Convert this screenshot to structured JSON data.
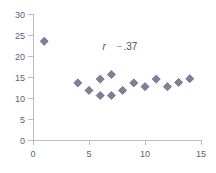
{
  "chart_data": {
    "type": "scatter",
    "title": "",
    "xlabel": "",
    "ylabel": "",
    "xlim": [
      0,
      15
    ],
    "ylim": [
      0,
      30
    ],
    "xticks": [
      "0",
      "5",
      "10",
      "15"
    ],
    "xtick_values": [
      0,
      5,
      10,
      15
    ],
    "yticks": [
      "0",
      "5",
      "10",
      "15",
      "20",
      "25",
      "30"
    ],
    "ytick_values": [
      0,
      5,
      10,
      15,
      20,
      25,
      30
    ],
    "grid": false,
    "legend": false,
    "marker_shape": "diamond",
    "marker_color": "#7d8098",
    "marker_edge_color": "#5c5f78",
    "axis_color": "#b9bcc6",
    "tick_label_color": "#5a5f7a",
    "points": [
      {
        "x": 1,
        "y": 23.5
      },
      {
        "x": 4,
        "y": 13.6
      },
      {
        "x": 5,
        "y": 11.8
      },
      {
        "x": 6,
        "y": 14.5
      },
      {
        "x": 6,
        "y": 10.6
      },
      {
        "x": 7,
        "y": 15.6
      },
      {
        "x": 7,
        "y": 10.6
      },
      {
        "x": 8,
        "y": 11.8
      },
      {
        "x": 9,
        "y": 13.6
      },
      {
        "x": 10,
        "y": 12.7
      },
      {
        "x": 11,
        "y": 14.5
      },
      {
        "x": 12,
        "y": 12.7
      },
      {
        "x": 13,
        "y": 13.7
      },
      {
        "x": 14,
        "y": 14.6
      }
    ],
    "annotations": [
      {
        "name": "correlation-annotation",
        "symbol": "r",
        "sign": "−",
        "value": ".37",
        "x": 6.2,
        "y": 21.5
      }
    ]
  }
}
